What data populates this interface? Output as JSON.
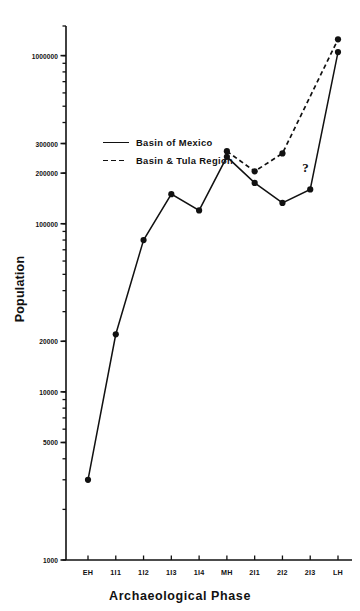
{
  "chart_data": {
    "type": "line",
    "title": "",
    "xlabel": "Archaeological  Phase",
    "ylabel": "Population",
    "yscale": "log",
    "ylim": [
      1000,
      1500000
    ],
    "grid": false,
    "legend_position": "upper-left-inside",
    "categories": [
      "EH",
      "1I1",
      "1I2",
      "1I3",
      "1I4",
      "MH",
      "2I1",
      "2I2",
      "2I3",
      "LH"
    ],
    "ytick_labels": [
      "1000",
      "5000",
      "10000",
      "20000",
      "100000",
      "200000",
      "300000",
      "1000000"
    ],
    "ytick_values": [
      1000,
      5000,
      10000,
      20000,
      100000,
      200000,
      300000,
      1000000
    ],
    "annotations": [
      {
        "text": "?",
        "category": "2I3",
        "series": "Basin & Tula  Region",
        "meaning": "value unknown"
      }
    ],
    "series": [
      {
        "name": "Basin of Mexico",
        "style": "solid",
        "marker": "filled-circle",
        "values": [
          3000,
          22000,
          80000,
          150000,
          120000,
          250000,
          175000,
          133000,
          160000,
          1050000
        ]
      },
      {
        "name": "Basin & Tula  Region",
        "style": "dashed",
        "marker": "filled-circle",
        "values": [
          null,
          null,
          null,
          null,
          null,
          270000,
          205000,
          262000,
          null,
          1250000
        ]
      }
    ]
  },
  "legend": {
    "items": [
      {
        "label": "Basin of Mexico",
        "style": "solid"
      },
      {
        "label": "Basin & Tula  Region",
        "style": "dashed"
      }
    ]
  },
  "axes": {
    "x_title": "Archaeological  Phase",
    "y_title": "Population"
  }
}
